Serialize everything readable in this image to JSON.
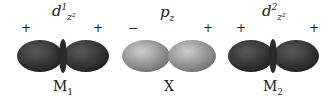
{
  "orbitals": [
    {
      "label_main": "d",
      "label_sup": "1",
      "label_sub": "z²",
      "left_sign": "+",
      "right_sign": "+",
      "name": "M",
      "name_sub": "1",
      "color": "#3a3a3a"
    },
    {
      "label_main": "p",
      "label_sub": "z",
      "left_sign": "−",
      "right_sign": "+",
      "name": "X",
      "name_sub": "",
      "color": "#9a9a9a"
    },
    {
      "label_main": "d",
      "label_sup": "2",
      "label_sub": "z²",
      "left_sign": "+",
      "right_sign": "+",
      "name": "M",
      "name_sub": "2",
      "color": "#3a3a3a"
    }
  ]
}
